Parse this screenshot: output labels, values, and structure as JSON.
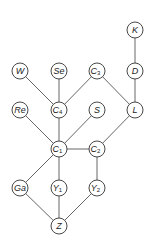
{
  "diagram": {
    "type": "graph",
    "colors": {
      "background": "#ffffff",
      "edge": "#555555",
      "node_stroke": "#333333",
      "text": "#222222"
    },
    "node_radius": 8,
    "nodes": [
      {
        "id": "K",
        "label": "K",
        "sub": "",
        "x": 135,
        "y": 30
      },
      {
        "id": "W",
        "label": "W",
        "sub": "",
        "x": 20,
        "y": 71
      },
      {
        "id": "Se",
        "label": "Se",
        "sub": "",
        "x": 59,
        "y": 71
      },
      {
        "id": "C3",
        "label": "C",
        "sub": "3",
        "x": 97,
        "y": 71
      },
      {
        "id": "D",
        "label": "D",
        "sub": "",
        "x": 135,
        "y": 71
      },
      {
        "id": "Re",
        "label": "Re",
        "sub": "",
        "x": 20,
        "y": 110
      },
      {
        "id": "C4",
        "label": "C",
        "sub": "4",
        "x": 59,
        "y": 110
      },
      {
        "id": "S",
        "label": "S",
        "sub": "",
        "x": 97,
        "y": 110
      },
      {
        "id": "L",
        "label": "L",
        "sub": "",
        "x": 135,
        "y": 110
      },
      {
        "id": "C1",
        "label": "C",
        "sub": "1",
        "x": 59,
        "y": 149
      },
      {
        "id": "C2",
        "label": "C",
        "sub": "2",
        "x": 97,
        "y": 149
      },
      {
        "id": "Ga",
        "label": "Ga",
        "sub": "",
        "x": 20,
        "y": 188
      },
      {
        "id": "Y1",
        "label": "Y",
        "sub": "1",
        "x": 59,
        "y": 188
      },
      {
        "id": "Y2",
        "label": "Y",
        "sub": "2",
        "x": 97,
        "y": 188
      },
      {
        "id": "Z",
        "label": "Z",
        "sub": "",
        "x": 59,
        "y": 226
      }
    ],
    "edges": [
      [
        "K",
        "D"
      ],
      [
        "D",
        "L"
      ],
      [
        "W",
        "C4"
      ],
      [
        "Se",
        "C4"
      ],
      [
        "C3",
        "C4"
      ],
      [
        "C3",
        "L"
      ],
      [
        "Re",
        "C1"
      ],
      [
        "C4",
        "C1"
      ],
      [
        "S",
        "C1"
      ],
      [
        "L",
        "C2"
      ],
      [
        "C1",
        "C2"
      ],
      [
        "C1",
        "Ga"
      ],
      [
        "C1",
        "Y1"
      ],
      [
        "C2",
        "Y2"
      ],
      [
        "Ga",
        "Z"
      ],
      [
        "Y1",
        "Z"
      ],
      [
        "Y2",
        "Z"
      ]
    ]
  }
}
